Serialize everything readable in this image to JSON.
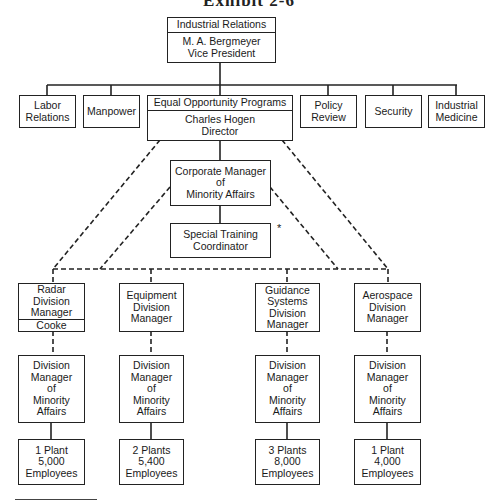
{
  "exhibit_title": "Exhibit 2-6",
  "top": {
    "unit": "Industrial Relations",
    "name": "M. A. Bergmeyer",
    "title": "Vice President"
  },
  "departments": [
    {
      "lines": [
        "Labor",
        "Relations"
      ]
    },
    {
      "lines": [
        "Manpower"
      ]
    },
    {
      "unit": "Equal Opportunity Programs",
      "name": "Charles Hogen",
      "title": "Director"
    },
    {
      "lines": [
        "Policy",
        "Review"
      ]
    },
    {
      "lines": [
        "Security"
      ]
    },
    {
      "lines": [
        "Industrial",
        "Medicine"
      ]
    }
  ],
  "corporate_manager": {
    "lines": [
      "Corporate Manager",
      "of",
      "Minority Affairs"
    ]
  },
  "special_training": {
    "lines": [
      "Special Training",
      "Coordinator"
    ],
    "footnote_mark": "*"
  },
  "divisions": [
    {
      "manager": [
        "Radar",
        "Division",
        "Manager"
      ],
      "manager_name": "Cooke",
      "minority": [
        "Division",
        "Manager",
        "of",
        "Minority",
        "Affairs"
      ],
      "plants": [
        "1 Plant",
        "5,000",
        "Employees"
      ]
    },
    {
      "manager": [
        "Equipment",
        "Division",
        "Manager"
      ],
      "minority": [
        "Division",
        "Manager",
        "of",
        "Minority",
        "Affairs"
      ],
      "plants": [
        "2 Plants",
        "5,400",
        "Employees"
      ]
    },
    {
      "manager": [
        "Guidance",
        "Systems",
        "Division",
        "Manager"
      ],
      "minority": [
        "Division",
        "Manager",
        "of",
        "Minority",
        "Affairs"
      ],
      "plants": [
        "3 Plants",
        "8,000",
        "Employees"
      ]
    },
    {
      "manager": [
        "Aerospace",
        "Division",
        "Manager"
      ],
      "minority": [
        "Division",
        "Manager",
        "of",
        "Minority",
        "Affairs"
      ],
      "plants": [
        "1 Plant",
        "4,000",
        "Employees"
      ]
    }
  ],
  "colors": {
    "line": "#222222",
    "background": "#ffffff"
  }
}
